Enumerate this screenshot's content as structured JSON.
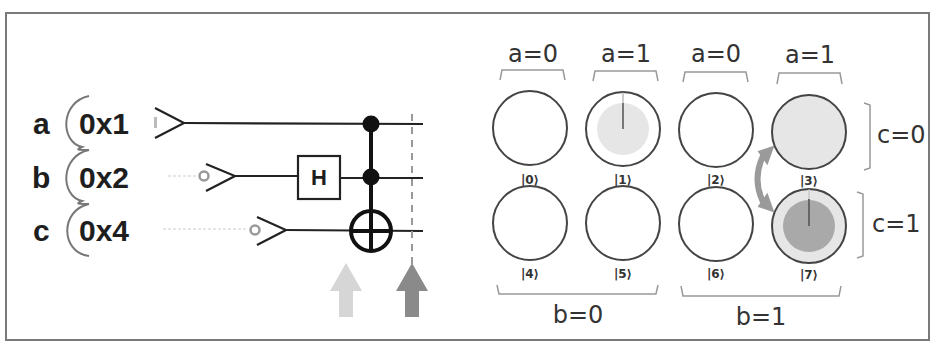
{
  "circuit": {
    "registers": [
      {
        "letter": "a",
        "value": "0x1"
      },
      {
        "letter": "b",
        "value": "0x2"
      },
      {
        "letter": "c",
        "value": "0x4"
      }
    ],
    "gates": {
      "hadamard_label": "H",
      "ccnot": "controlled-controlled-NOT (controls a, b; target c)"
    },
    "markers": {
      "before_arrow_color": "#d6d6d6",
      "after_arrow_color": "#8a8a8a"
    }
  },
  "state_grid": {
    "column_labels": [
      "a=0",
      "a=1",
      "a=0",
      "a=1"
    ],
    "row_labels": [
      "c=0",
      "c=1"
    ],
    "group_labels": [
      "b=0",
      "b=1"
    ],
    "states": [
      {
        "ket": "|0⟩",
        "fill": "none"
      },
      {
        "ket": "|1⟩",
        "fill": "light-partial"
      },
      {
        "ket": "|2⟩",
        "fill": "none"
      },
      {
        "ket": "|3⟩",
        "fill": "light-full"
      },
      {
        "ket": "|4⟩",
        "fill": "none"
      },
      {
        "ket": "|5⟩",
        "fill": "none"
      },
      {
        "ket": "|6⟩",
        "fill": "none"
      },
      {
        "ket": "|7⟩",
        "fill": "dark-partial"
      }
    ],
    "colors": {
      "light_fill": "#e6e6e6",
      "dark_fill": "#a9a9a9",
      "swap_arrow": "#9a9a9a",
      "stroke": "#444444"
    }
  }
}
